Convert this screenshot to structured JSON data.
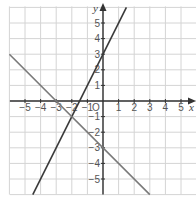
{
  "chart_data": {
    "type": "line",
    "title": "",
    "xlabel": "x",
    "ylabel": "y",
    "origin_label": "O",
    "xlim": [
      -6,
      6
    ],
    "ylim": [
      -6,
      6
    ],
    "grid": true,
    "x_ticks": [
      -5,
      -4,
      -3,
      -2,
      -1,
      1,
      2,
      3,
      4,
      5
    ],
    "y_ticks": [
      -5,
      -4,
      -3,
      -2,
      -1,
      1,
      2,
      3,
      4,
      5
    ],
    "series": [
      {
        "name": "y = 2x + 3",
        "slope": 2,
        "intercept": 3,
        "x": [
          -4.5,
          1.5
        ],
        "y": [
          -6,
          6
        ],
        "color": "#3a3a3a"
      },
      {
        "name": "y = -x - 3",
        "slope": -1,
        "intercept": -3,
        "x": [
          -6,
          3
        ],
        "y": [
          3,
          -6
        ],
        "color": "#7a7a7a"
      }
    ],
    "annotations": [
      {
        "label": "intersection",
        "x": -2,
        "y": -1
      }
    ]
  },
  "figure": {
    "part_label": ""
  }
}
